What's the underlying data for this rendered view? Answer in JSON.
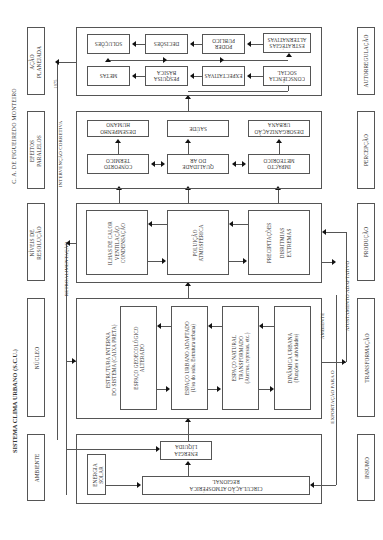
{
  "title": "SISTEMA CLIMA URBANO (S.C.U.)",
  "author": "C. A. DE FIGUEIREDO MONTEIRO",
  "left_labels": [
    "AMBIENTE",
    "NÚCLEO",
    "NÍVEIS DE\nRESOLUÇÃO",
    "EFEITOS\nPARALELOS",
    "AÇÃO\nPLANEJADA"
  ],
  "right_labels": [
    "INSUMO",
    "TRANSFORMAÇÃO",
    "PRODUÇÃO",
    "PERCEPÇÃO",
    "AUTORREGULAÇÃO"
  ],
  "connector_labels": {
    "retroalimentacao": "RETROALIMENTAÇÃO",
    "intervencao": "INTERVENÇÃO CORRETIVA",
    "year": "1975",
    "exportacao": "EXPORTAÇÃO PARA O",
    "ambiente": "AMBIENTE",
    "ajustamento": "AJUSTAMENTO ADAPTATIVO"
  },
  "insumo_panel": {
    "energia_solar": "ENERGIA\nSOLAR",
    "energia_liquida": "ENERGIA\nLÍQUIDA",
    "circulacao": "CIRCULAÇÃO ATMOSFÉRICA\nREGIONAL"
  },
  "nucleo_panel": {
    "estrutura": "ESTRUTURA INTERNA\nDO SISTEMA (CAIXA PRETA)",
    "items": [
      "ESPAÇO GEOECOLÓGICO\nALTERADO",
      "ESPAÇO URBANO ADAPTADO\n(Uso do solo, Estrutura urbana)",
      "ESPAÇO NATURAL\nTRANSFORMADO\n(Aterros, represas, etc.)",
      "DINÂMICA URBANA\n(Funções e atividades)"
    ]
  },
  "resolucao_panel": {
    "items": [
      "ILHAS DE CALOR\nVENTILAÇÃO\nCONDENSAÇÃO",
      "POLUIÇÃO\nATMOSFÉRICA",
      "PRECIPITAÇÕES\n\nDISRITMIAS\nEXTREMAS"
    ]
  },
  "efeitos_panel": {
    "top_row": [
      "DESEMPENHO\nHUMANO",
      "SAÚDE",
      "DESORGANIZAÇÃO\nURBANA"
    ],
    "bottom_row": [
      "CONFORTO\nTÉRMICO",
      "QUALIDADE\nDO AR",
      "IMPACTO\nMETEÓRICO"
    ]
  },
  "acao_panel": {
    "top_row": [
      "SOLUÇÕES",
      "DECISÕES",
      "PODER\nPÚBLICO",
      "ESTRATÉGIAS\nALTERNATIVAS"
    ],
    "bottom_row": [
      "METAS",
      "PESQUISA\nBÁSICA",
      "EXPECTATIVAS",
      "CONSCIÊNCIA\nSOCIAL"
    ]
  }
}
